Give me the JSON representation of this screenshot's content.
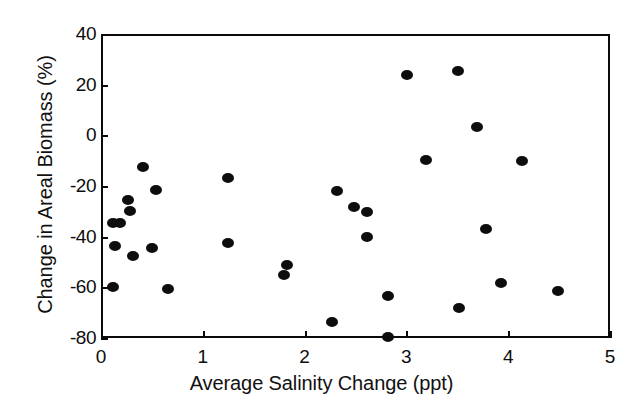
{
  "chart_data": {
    "type": "scatter",
    "title": "",
    "xlabel": "Average Salinity Change (ppt)",
    "ylabel": "Change in Areal Biomass (%)",
    "xlim": [
      0,
      5
    ],
    "ylim": [
      -80,
      40
    ],
    "xticks": [
      0,
      1,
      2,
      3,
      4,
      5
    ],
    "xtick_labels": [
      "0",
      "1",
      "2",
      "3",
      "4",
      "5"
    ],
    "yticks": [
      -80,
      -60,
      -40,
      -20,
      0,
      20,
      40
    ],
    "ytick_labels": [
      "-80",
      "-60",
      "-40",
      "-20",
      "0",
      "20",
      "40"
    ],
    "grid": false,
    "legend": false,
    "marker": "filled-circle",
    "marker_color": "#0d0d0d",
    "series": [
      {
        "name": "sites",
        "points": [
          {
            "x": 0.12,
            "y": -60.0
          },
          {
            "x": 0.12,
            "y": -34.5
          },
          {
            "x": 0.19,
            "y": -34.5
          },
          {
            "x": 0.14,
            "y": -43.5
          },
          {
            "x": 0.27,
            "y": -25.5
          },
          {
            "x": 0.28,
            "y": -29.9
          },
          {
            "x": 0.31,
            "y": -47.5
          },
          {
            "x": 0.41,
            "y": -12.5
          },
          {
            "x": 0.5,
            "y": -44.5
          },
          {
            "x": 0.54,
            "y": -21.5
          },
          {
            "x": 0.66,
            "y": -60.5
          },
          {
            "x": 1.25,
            "y": -16.9
          },
          {
            "x": 1.25,
            "y": -42.5
          },
          {
            "x": 1.8,
            "y": -55.0
          },
          {
            "x": 1.83,
            "y": -51.0
          },
          {
            "x": 2.27,
            "y": -73.5
          },
          {
            "x": 2.32,
            "y": -21.9
          },
          {
            "x": 2.49,
            "y": -28.3
          },
          {
            "x": 2.61,
            "y": -30.3
          },
          {
            "x": 2.61,
            "y": -40.2
          },
          {
            "x": 2.82,
            "y": -79.6
          },
          {
            "x": 2.82,
            "y": -63.4
          },
          {
            "x": 3.01,
            "y": 24.0
          },
          {
            "x": 3.19,
            "y": -9.7
          },
          {
            "x": 3.51,
            "y": 25.4
          },
          {
            "x": 3.52,
            "y": -68.0
          },
          {
            "x": 3.69,
            "y": 3.3
          },
          {
            "x": 3.78,
            "y": -37.0
          },
          {
            "x": 3.93,
            "y": -58.3
          },
          {
            "x": 4.14,
            "y": -10.1
          },
          {
            "x": 4.49,
            "y": -61.4
          }
        ]
      }
    ]
  }
}
